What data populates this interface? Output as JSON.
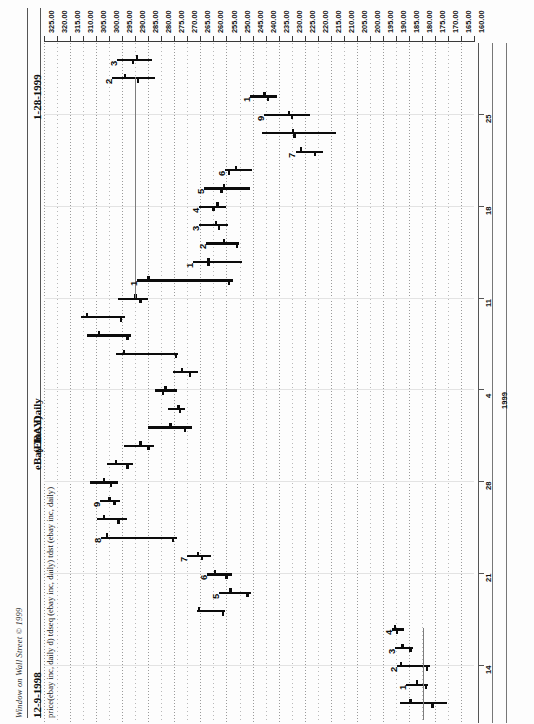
{
  "header": {
    "copyright": "Window on Wall Street © 1999",
    "date_start": "12-9-1998",
    "date_end": "1-28-1999",
    "ticker": "(EBAY)",
    "title": "eBay Inc, Daily",
    "series_legend": "price(ebay inc, daily d)  tdseq (ebay inc, daily)  tdst (ebay inc, daily)"
  },
  "chart_data": {
    "type": "bar",
    "title": "eBay Inc, Daily",
    "subtitle": "(EBAY)  12-9-1998 to 1-28-1999",
    "xlabel": "Price",
    "ylabel": "Date",
    "grid": true,
    "orientation": "rotated-90-ccw",
    "legend": "price(ebay inc, daily d)  tdseq (ebay inc, daily)  tdst (ebay inc, daily)",
    "price_axis": {
      "ticks": [
        "325.00",
        "320.00",
        "315.00",
        "310.00",
        "305.00",
        "300.00",
        "295.00",
        "290.00",
        "285.00",
        "280.00",
        "275.00",
        "270.00",
        "265.00",
        "260.00",
        "255.00",
        "250.00",
        "245.00",
        "240.00",
        "235.00",
        "230.00",
        "225.00",
        "220.00",
        "215.00",
        "210.00",
        "205.00",
        "200.00",
        "195.00",
        "190.00",
        "185.00",
        "180.00",
        "175.00",
        "170.00",
        "165.00",
        "160.00"
      ],
      "min": 160.0,
      "max": 325.0,
      "step": 5.0,
      "direction": "descending-left-to-right"
    },
    "time_axis": {
      "ticks": [
        "25",
        "18",
        "11",
        "4",
        "28",
        "21",
        "14"
      ],
      "year_label": "1999",
      "direction": "latest-at-top"
    },
    "bars": [
      {
        "i": 0,
        "high": 297.0,
        "low": 283.5,
        "open": 289.5,
        "close": 291.0,
        "td": "3"
      },
      {
        "i": 1,
        "high": 299.0,
        "low": 282.5,
        "open": 294.0,
        "close": 289.0,
        "td": "2"
      },
      {
        "i": 2,
        "high": 246.0,
        "low": 235.5,
        "open": 240.5,
        "close": 239.0,
        "td": "1"
      },
      {
        "i": 3,
        "high": 240.5,
        "low": 223.0,
        "open": 231.0,
        "close": 230.0,
        "td": "9"
      },
      {
        "i": 4,
        "high": 241.5,
        "low": 213.0,
        "open": 229.5,
        "close": 229.0,
        "td": ""
      },
      {
        "i": 5,
        "high": 228.5,
        "low": 218.0,
        "open": 226.5,
        "close": 221.0,
        "td": "7"
      },
      {
        "i": 6,
        "high": 255.5,
        "low": 245.0,
        "open": 251.5,
        "close": 254.0,
        "td": "6"
      },
      {
        "i": 7,
        "high": 263.5,
        "low": 246.0,
        "open": 256.0,
        "close": 257.0,
        "td": "5"
      },
      {
        "i": 8,
        "high": 265.5,
        "low": 255.0,
        "open": 258.5,
        "close": 260.0,
        "td": "4"
      },
      {
        "i": 9,
        "high": 265.5,
        "low": 254.5,
        "open": 259.0,
        "close": 258.0,
        "td": "3"
      },
      {
        "i": 10,
        "high": 263.0,
        "low": 250.0,
        "open": 256.0,
        "close": 251.0,
        "td": "2"
      },
      {
        "i": 11,
        "high": 268.0,
        "low": 249.0,
        "open": 262.0,
        "close": 262.0,
        "td": "1"
      },
      {
        "i": 12,
        "high": 289.5,
        "low": 252.5,
        "open": 285.0,
        "close": 254.0,
        "td": "1"
      },
      {
        "i": 13,
        "high": 296.5,
        "low": 285.0,
        "open": 290.0,
        "close": 288.0,
        "td": ""
      },
      {
        "i": 14,
        "high": 311.0,
        "low": 294.0,
        "open": 308.5,
        "close": 295.5,
        "td": ""
      },
      {
        "i": 15,
        "high": 308.5,
        "low": 291.5,
        "open": 304.0,
        "close": 293.0,
        "td": ""
      },
      {
        "i": 16,
        "high": 297.5,
        "low": 273.5,
        "open": 294.5,
        "close": 274.5,
        "td": ""
      },
      {
        "i": 17,
        "high": 275.5,
        "low": 266.0,
        "open": 272.0,
        "close": 269.0,
        "td": ""
      },
      {
        "i": 18,
        "high": 282.5,
        "low": 274.0,
        "open": 278.5,
        "close": 279.5,
        "td": ""
      },
      {
        "i": 19,
        "high": 277.5,
        "low": 271.0,
        "open": 273.5,
        "close": 273.0,
        "td": ""
      },
      {
        "i": 20,
        "high": 285.0,
        "low": 268.0,
        "open": 276.5,
        "close": 271.0,
        "td": ""
      },
      {
        "i": 21,
        "high": 294.5,
        "low": 283.0,
        "open": 288.0,
        "close": 285.0,
        "td": ""
      },
      {
        "i": 22,
        "high": 301.0,
        "low": 291.0,
        "open": 297.5,
        "close": 293.0,
        "td": ""
      },
      {
        "i": 23,
        "high": 307.5,
        "low": 296.5,
        "open": 302.0,
        "close": 299.5,
        "td": ""
      },
      {
        "i": 24,
        "high": 303.5,
        "low": 296.0,
        "open": 300.0,
        "close": 298.0,
        "td": "9"
      },
      {
        "i": 25,
        "high": 304.5,
        "low": 293.0,
        "open": 302.0,
        "close": 296.5,
        "td": ""
      },
      {
        "i": 26,
        "high": 303.0,
        "low": 274.0,
        "open": 301.0,
        "close": 275.5,
        "td": "8"
      },
      {
        "i": 27,
        "high": 270.0,
        "low": 261.0,
        "open": 266.0,
        "close": 264.5,
        "td": "7"
      },
      {
        "i": 28,
        "high": 262.5,
        "low": 253.0,
        "open": 259.5,
        "close": 255.0,
        "td": "6"
      },
      {
        "i": 29,
        "high": 258.0,
        "low": 245.5,
        "open": 253.5,
        "close": 247.0,
        "td": "5"
      },
      {
        "i": 30,
        "high": 266.5,
        "low": 255.5,
        "open": 265.5,
        "close": 256.5,
        "td": ""
      },
      {
        "i": 31,
        "high": 191.5,
        "low": 187.0,
        "open": 190.5,
        "close": 189.5,
        "td": "4"
      },
      {
        "i": 32,
        "high": 190.5,
        "low": 183.5,
        "open": 187.5,
        "close": 184.5,
        "td": "3"
      },
      {
        "i": 33,
        "high": 189.5,
        "low": 177.0,
        "open": 188.0,
        "close": 178.0,
        "td": "2"
      },
      {
        "i": 34,
        "high": 186.0,
        "low": 177.5,
        "open": 182.0,
        "close": 178.5,
        "td": "1"
      },
      {
        "i": 35,
        "high": 188.5,
        "low": 170.5,
        "open": 184.5,
        "close": 176.0,
        "td": ""
      }
    ],
    "annotations": {
      "tdst_resistance_price": 290.0,
      "tdst_support_price": 179.5
    }
  }
}
